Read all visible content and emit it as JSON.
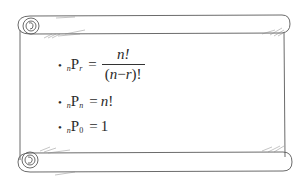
{
  "scroll": {
    "stroke_color": "#555555",
    "background": "#ffffff"
  },
  "formulas": [
    {
      "bullet": "•",
      "pre_sub": "n",
      "symbol": "P",
      "post_sub": "r",
      "equals": "=",
      "numerator": "n!",
      "denominator_open": "(",
      "denominator_var1": "n",
      "denominator_minus": "−",
      "denominator_var2": "r",
      "denominator_close": ")!"
    },
    {
      "bullet": "•",
      "pre_sub": "n",
      "symbol": "P",
      "post_sub": "n",
      "equals": "=",
      "rhs_var": "n",
      "rhs_suffix": "!"
    },
    {
      "bullet": "•",
      "pre_sub": "n",
      "symbol": "P",
      "post_sub": "0",
      "equals": "=",
      "rhs": "1"
    }
  ]
}
